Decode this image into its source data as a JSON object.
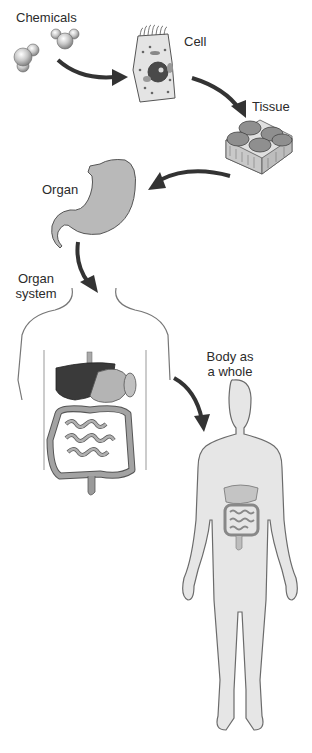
{
  "diagram": {
    "type": "levels-of-organization",
    "colors": {
      "background": "#ffffff",
      "arrow": "#333333",
      "tissue_fill": "#8f8f8f",
      "organ_fill": "#b9b9b9",
      "body_fill": "#e6e6e6",
      "body_outline": "#6b6b6b",
      "liver_fill": "#3a3a3a",
      "intestine_fill": "#9d9d9d",
      "text": "#2b2b2b"
    },
    "stages": [
      {
        "id": "chemicals",
        "label": "Chemicals"
      },
      {
        "id": "cell",
        "label": "Cell"
      },
      {
        "id": "tissue",
        "label": "Tissue"
      },
      {
        "id": "organ",
        "label": "Organ"
      },
      {
        "id": "organ_system",
        "label_line1": "Organ",
        "label_line2": "system"
      },
      {
        "id": "body",
        "label_line1": "Body as",
        "label_line2": "a whole"
      }
    ],
    "arrows": [
      {
        "from": "chemicals",
        "to": "cell"
      },
      {
        "from": "cell",
        "to": "tissue"
      },
      {
        "from": "tissue",
        "to": "organ"
      },
      {
        "from": "organ",
        "to": "organ_system"
      },
      {
        "from": "organ_system",
        "to": "body"
      }
    ]
  }
}
